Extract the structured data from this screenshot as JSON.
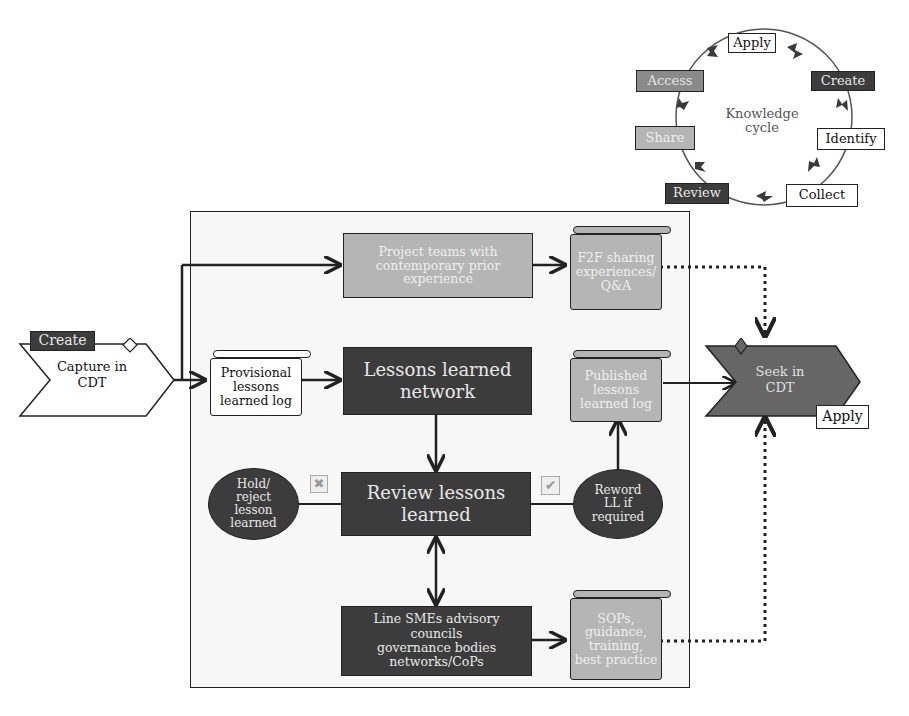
{
  "knowledge_cycle": {
    "center_label": "Knowledge cycle",
    "stages": [
      {
        "label": "Apply",
        "style": "white"
      },
      {
        "label": "Create",
        "style": "dark"
      },
      {
        "label": "Identify",
        "style": "white"
      },
      {
        "label": "Collect",
        "style": "white"
      },
      {
        "label": "Review",
        "style": "dark"
      },
      {
        "label": "Share",
        "style": "light"
      },
      {
        "label": "Access",
        "style": "mid"
      }
    ]
  },
  "capture": {
    "tag": "Create",
    "label": "Capture in CDT"
  },
  "seek": {
    "tag": "Apply",
    "label": "Seek in CDT"
  },
  "nodes": {
    "project_teams": "Project teams with contemporary prior experience",
    "f2f_sharing": "F2F sharing experiences/ Q&A",
    "provisional_log": "Provisional lessons learned log",
    "ll_network": "Lessons learned network",
    "published_log": "Published lessons learned log",
    "review_ll": "Review lessons learned",
    "hold_reject": "Hold/ reject lesson learned",
    "reword": "Reword LL if required",
    "line_smes": "Line SMEs advisory councils governance bodies networks/CoPs",
    "sops": "SOPs, guidance, training, best practice"
  },
  "decision_icons": {
    "reject": "cross-box",
    "accept": "check-box"
  },
  "colors": {
    "dark": "#3c3c3c",
    "mid": "#8a8a8a",
    "light": "#b5b5b5",
    "frame_bg": "#f7f7f7",
    "line": "#222222"
  }
}
